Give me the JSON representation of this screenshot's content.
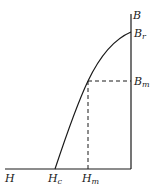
{
  "diagram": {
    "title": "",
    "type": "B-H demagnetization curve",
    "axes": {
      "horizontal_label": "H",
      "vertical_label": "B"
    },
    "points": {
      "remanence": {
        "symbol": "B",
        "subscript": "r"
      },
      "coercivity": {
        "symbol": "H",
        "subscript": "c"
      },
      "operating_B": {
        "symbol": "B",
        "subscript": "m"
      },
      "operating_H": {
        "symbol": "H",
        "subscript": "m"
      }
    },
    "colors": {
      "line": "#1a1a1a",
      "background": "#ffffff"
    }
  }
}
